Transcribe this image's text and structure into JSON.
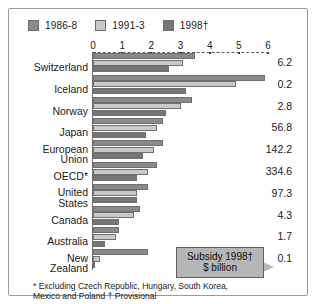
{
  "chart_data": {
    "type": "bar",
    "orientation": "horizontal",
    "title": "",
    "subtitle": "",
    "xlabel": "",
    "ylabel": "",
    "xlim": [
      0,
      6
    ],
    "xticks": [
      0,
      1,
      2,
      3,
      4,
      5,
      6
    ],
    "xtick_labels": [
      "0",
      "1",
      "2",
      "3",
      "4",
      "5",
      "6"
    ],
    "grid": false,
    "legend_position": "top-left",
    "categories": [
      "Switzerland",
      "Iceland",
      "Norway",
      "Japan",
      "European\nUnion",
      "OECD*",
      "United\nStates",
      "Canada",
      "Australia",
      "New\nZealand"
    ],
    "series": [
      {
        "name": "1986-8",
        "color": "#8a8a8a",
        "values": [
          3.5,
          5.9,
          3.4,
          2.4,
          2.4,
          2.2,
          1.9,
          1.6,
          0.9,
          1.9
        ]
      },
      {
        "name": "1991-3",
        "color": "#c9c9c9",
        "values": [
          3.1,
          4.9,
          3.0,
          2.2,
          2.1,
          1.9,
          1.5,
          1.4,
          0.8,
          0.25
        ]
      },
      {
        "name": "1998†",
        "color": "#767676",
        "values": [
          2.6,
          3.2,
          2.5,
          1.8,
          1.7,
          1.5,
          1.5,
          0.9,
          0.4,
          0.08
        ]
      }
    ],
    "annotations": {
      "right_column_header": "",
      "right_column_values": [
        "6.2",
        "0.2",
        "2.8",
        "56.8",
        "142.2",
        "334.6",
        "97.3",
        "4.3",
        "1.7",
        "0.1"
      ]
    }
  },
  "legend": {
    "items": [
      {
        "label": "1986-8",
        "color": "#8a8a8a"
      },
      {
        "label": "1991-3",
        "color": "#c9c9c9"
      },
      {
        "label": "1998†",
        "color": "#767676"
      }
    ]
  },
  "axis": {
    "tick_labels": [
      "0",
      "1",
      "2",
      "3",
      "4",
      "5",
      "6"
    ]
  },
  "callout": {
    "line1": "Subsidy 1998†",
    "line2": "$ billion"
  },
  "footnote": {
    "line1": "* Excluding Czech Republic, Hungary, South Korea,",
    "line2": "Mexico and Poland † Provisional"
  }
}
